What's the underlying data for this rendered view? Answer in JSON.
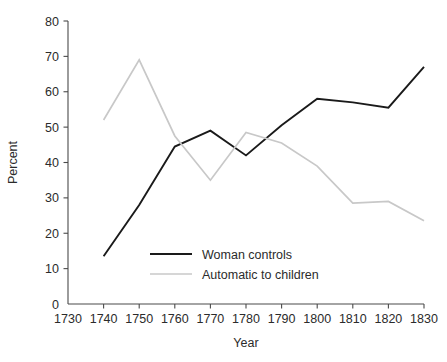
{
  "chart_data": {
    "type": "line",
    "title": "",
    "subtitle": "",
    "xlabel": "Year",
    "ylabel": "Percent",
    "x": [
      1740,
      1750,
      1760,
      1770,
      1780,
      1790,
      1800,
      1810,
      1820,
      1830
    ],
    "xlim": [
      1730,
      1830
    ],
    "ylim": [
      0,
      80
    ],
    "xticks": [
      1730,
      1740,
      1750,
      1760,
      1770,
      1780,
      1790,
      1800,
      1810,
      1820,
      1830
    ],
    "yticks": [
      0,
      10,
      20,
      30,
      40,
      50,
      60,
      70,
      80
    ],
    "grid": false,
    "legend_position": "inside-lower-center",
    "series": [
      {
        "name": "Woman controls",
        "color": "#1a1a1a",
        "width": 1.9,
        "values": [
          13.5,
          28.0,
          44.5,
          49.0,
          42.0,
          50.5,
          58.0,
          57.0,
          55.5,
          67.0
        ]
      },
      {
        "name": "Automatic to children",
        "color": "#c8c8c8",
        "width": 1.7,
        "values": [
          52.0,
          69.0,
          47.5,
          35.0,
          48.5,
          45.5,
          39.0,
          28.5,
          29.0,
          23.5
        ]
      }
    ]
  },
  "axes": {
    "y_tick_labels": [
      "0",
      "10",
      "20",
      "30",
      "40",
      "50",
      "60",
      "70",
      "80"
    ],
    "x_tick_labels": [
      "1730",
      "1740",
      "1750",
      "1760",
      "1770",
      "1780",
      "1790",
      "1800",
      "1810",
      "1820",
      "1830"
    ],
    "y_axis_title": "Percent",
    "x_axis_title": "Year"
  },
  "legend": {
    "entries": [
      {
        "label": "Woman controls",
        "swatch": "legend-swatch-black"
      },
      {
        "label": "Automatic to children",
        "swatch": "legend-swatch-gray"
      }
    ]
  }
}
